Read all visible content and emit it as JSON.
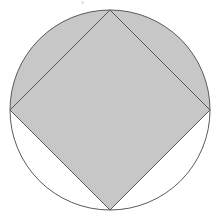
{
  "figure": {
    "background_color": "#ffffff",
    "shaded_color": "#c7c7c7",
    "unshaded_color": "#ffffff",
    "stroke_color": "#5a5a5a",
    "stroke_width": 1,
    "canvas": {
      "width": 221,
      "height": 218
    },
    "circle": {
      "name": "circle",
      "center_x": 110,
      "center_y": 110,
      "radius": 100,
      "fill": "#ffffff",
      "stroke": "#5a5a5a"
    },
    "square": {
      "name": "inscribed-square",
      "rotation_degrees": 45,
      "fill": "#c7c7c7",
      "stroke": "#5a5a5a",
      "vertices": [
        {
          "label": "top",
          "x": 110,
          "y": 10
        },
        {
          "label": "right",
          "x": 210,
          "y": 110
        },
        {
          "label": "bottom",
          "x": 110,
          "y": 210
        },
        {
          "label": "left",
          "x": 10,
          "y": 110
        }
      ],
      "path": "M 110 10 L 210 110 L 110 210 L 10 110 Z"
    },
    "segments": [
      {
        "name": "upper-left-segment",
        "shaded": true,
        "fill": "#c7c7c7",
        "path": "M 110 10 A 100 100 0 0 0 10 110 L 110 10 Z"
      },
      {
        "name": "upper-right-segment",
        "shaded": true,
        "fill": "#c7c7c7",
        "path": "M 110 10 A 100 100 0 0 1 210 110 L 110 10 Z"
      },
      {
        "name": "lower-right-segment",
        "shaded": false,
        "fill": "#ffffff",
        "path": "M 210 110 A 100 100 0 0 1 110 210 L 210 110 Z"
      },
      {
        "name": "lower-left-segment",
        "shaded": false,
        "fill": "#ffffff",
        "path": "M 110 210 A 100 100 0 0 1 10 110 L 110 210 Z"
      }
    ],
    "shaded_region_path": "M 110 10 A 100 100 0 0 0 10 110 L 110 210 L 210 110 A 100 100 0 0 0 110 10 Z",
    "artifacts": [
      {
        "name": "scan-speck",
        "x": 81,
        "y": 1
      }
    ]
  }
}
